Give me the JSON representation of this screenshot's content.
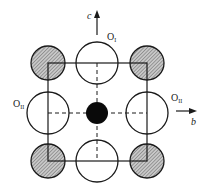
{
  "diagram": {
    "type": "crystal-structure-projection",
    "colors": {
      "line": "#1a1a1a",
      "hatch_fill": "#8a8a8a",
      "hatch_bg": "#c8c8c8",
      "central_atom": "#0a0a0a",
      "open_atom": "#ffffff"
    },
    "axes": {
      "c": {
        "label": "c",
        "direction": "up"
      },
      "b": {
        "label": "b",
        "direction": "right"
      }
    },
    "labels": {
      "o1": {
        "base": "O",
        "sub": "I"
      },
      "o2_left": {
        "base": "O",
        "sub": "II"
      },
      "o2_right": {
        "base": "O",
        "sub": "II"
      }
    },
    "atoms": [
      {
        "id": "corner-tl",
        "kind": "hatched",
        "cx": 48,
        "cy": 63,
        "r": 17
      },
      {
        "id": "corner-tr",
        "kind": "hatched",
        "cx": 147,
        "cy": 63,
        "r": 17
      },
      {
        "id": "corner-bl",
        "kind": "hatched",
        "cx": 48,
        "cy": 161,
        "r": 17
      },
      {
        "id": "corner-br",
        "kind": "hatched",
        "cx": 147,
        "cy": 161,
        "r": 17
      },
      {
        "id": "oxygen-top",
        "kind": "open",
        "cx": 97,
        "cy": 63,
        "r": 21
      },
      {
        "id": "oxygen-bottom",
        "kind": "open",
        "cx": 97,
        "cy": 161,
        "r": 21
      },
      {
        "id": "oxygen-left",
        "kind": "open",
        "cx": 48,
        "cy": 113,
        "r": 21
      },
      {
        "id": "oxygen-right",
        "kind": "open",
        "cx": 147,
        "cy": 113,
        "r": 21
      },
      {
        "id": "center",
        "kind": "solid",
        "cx": 97,
        "cy": 113,
        "r": 11
      }
    ]
  }
}
